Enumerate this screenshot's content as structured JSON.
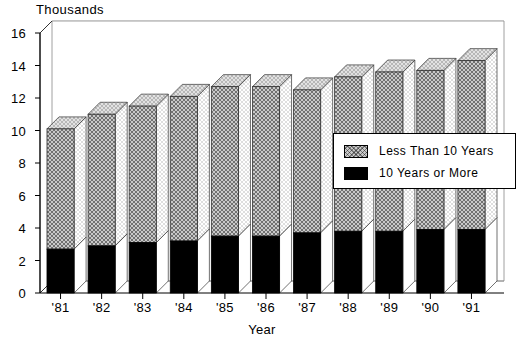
{
  "chart_data": {
    "type": "bar",
    "subtype": "stacked-3d-column",
    "title": "",
    "unit_label": "Thousands",
    "xlabel": "Year",
    "ylabel": "",
    "categories": [
      "'81",
      "'82",
      "'83",
      "'84",
      "'85",
      "'86",
      "'87",
      "'88",
      "'89",
      "'90",
      "'91"
    ],
    "ylim": [
      0,
      16
    ],
    "yticks": [
      0,
      2,
      4,
      6,
      8,
      10,
      12,
      14,
      16
    ],
    "grid": true,
    "legend_position": "inside-right",
    "series": [
      {
        "name": "10 Years or More",
        "color": "#000000",
        "fill": "solid-black",
        "values": [
          2.7,
          2.9,
          3.1,
          3.2,
          3.5,
          3.5,
          3.7,
          3.8,
          3.8,
          3.9,
          3.9
        ]
      },
      {
        "name": "Less Than 10 Years",
        "color": "#c9c9c9",
        "fill": "cross-hatch",
        "values": [
          7.4,
          8.1,
          8.4,
          8.9,
          9.2,
          9.2,
          8.8,
          9.5,
          9.8,
          9.8,
          10.4
        ]
      }
    ],
    "totals": [
      10.1,
      11.0,
      11.5,
      12.1,
      12.7,
      12.7,
      12.5,
      13.3,
      13.6,
      13.7,
      14.3
    ]
  },
  "legend": {
    "items": [
      {
        "label": "Less Than 10 Years",
        "swatch": "hatch"
      },
      {
        "label": "10 Years or More",
        "swatch": "solid"
      }
    ]
  }
}
